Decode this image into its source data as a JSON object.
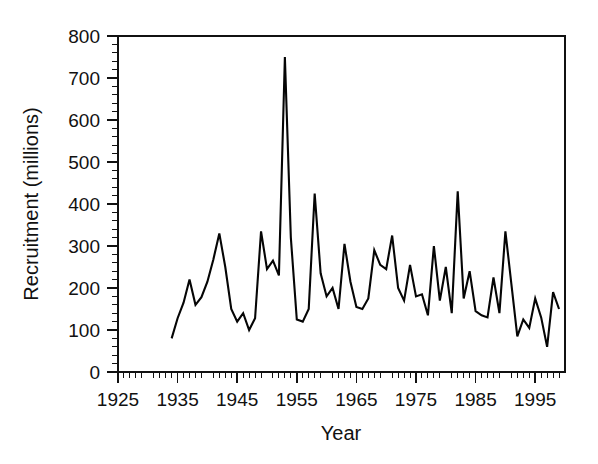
{
  "chart_data": {
    "type": "line",
    "title": "",
    "xlabel": "Year",
    "ylabel": "Recruitment (millions)",
    "xlim": [
      1925,
      2000
    ],
    "ylim": [
      0,
      800
    ],
    "grid": false,
    "legend": null,
    "series_name": "Recruitment",
    "line_color": "#050505",
    "x_ticks": [
      1925,
      1935,
      1945,
      1955,
      1965,
      1975,
      1985,
      1995
    ],
    "x_tick_labels": [
      "1925",
      "1935",
      "1945",
      "1955",
      "1965",
      "1975",
      "1985",
      "1995"
    ],
    "x_minor_step": 1,
    "y_ticks": [
      0,
      100,
      200,
      300,
      400,
      500,
      600,
      700,
      800
    ],
    "y_tick_labels": [
      "0",
      "100",
      "200",
      "300",
      "400",
      "500",
      "600",
      "700",
      "800"
    ],
    "y_minor_step": 20,
    "x": [
      1934,
      1935,
      1936,
      1937,
      1938,
      1939,
      1940,
      1941,
      1942,
      1943,
      1944,
      1945,
      1946,
      1947,
      1948,
      1949,
      1950,
      1951,
      1952,
      1953,
      1954,
      1955,
      1956,
      1957,
      1958,
      1959,
      1960,
      1961,
      1962,
      1963,
      1964,
      1965,
      1966,
      1967,
      1968,
      1969,
      1970,
      1971,
      1972,
      1973,
      1974,
      1975,
      1976,
      1977,
      1978,
      1979,
      1980,
      1981,
      1982,
      1983,
      1984,
      1985,
      1986,
      1987,
      1988,
      1989,
      1990,
      1991,
      1992,
      1993,
      1994,
      1995,
      1996,
      1997,
      1998,
      1999
    ],
    "values": [
      80,
      128,
      165,
      220,
      160,
      178,
      215,
      268,
      330,
      250,
      150,
      120,
      140,
      100,
      128,
      335,
      245,
      265,
      230,
      750,
      320,
      125,
      120,
      150,
      425,
      235,
      180,
      200,
      150,
      305,
      215,
      155,
      150,
      175,
      290,
      255,
      245,
      325,
      200,
      170,
      255,
      180,
      185,
      135,
      300,
      170,
      250,
      140,
      430,
      175,
      240,
      145,
      135,
      130,
      225,
      140,
      335,
      210,
      85,
      125,
      105,
      175,
      130,
      60,
      190,
      150
    ],
    "units": "millions",
    "annotations": [
      {
        "label": "peak",
        "x": 1953,
        "y": 750
      },
      {
        "label": "secondary-peak",
        "x": 1982,
        "y": 430
      },
      {
        "label": "secondary-peak",
        "x": 1958,
        "y": 425
      }
    ]
  },
  "axes": {
    "y_title": "Recruitment (millions)",
    "x_title": "Year"
  }
}
